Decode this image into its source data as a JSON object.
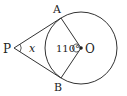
{
  "diagram": {
    "type": "geometry",
    "labels": {
      "P": "P",
      "A": "A",
      "B": "B",
      "O": "O",
      "angle_x": "x",
      "angle_center": "110°"
    },
    "points": {
      "P": [
        14,
        48
      ],
      "A": [
        61,
        18
      ],
      "B": [
        61,
        78
      ],
      "O": [
        81,
        48
      ]
    },
    "circle": {
      "cx": 81,
      "cy": 48,
      "r": 36
    },
    "colors": {
      "stroke": "#333333",
      "text": "#222222",
      "background": "#ffffff"
    }
  }
}
